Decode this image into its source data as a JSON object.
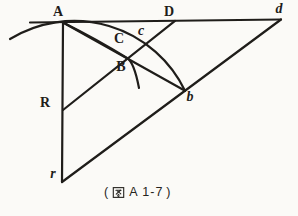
{
  "figure": {
    "caption": {
      "full": "( 图 A 1-7 )",
      "open": "(",
      "cjk": "图",
      "text": "A 1-7",
      "close": ")"
    },
    "labels": {
      "A": "A",
      "D": "D",
      "d": "d",
      "C": "C",
      "c": "c",
      "B": "B",
      "R": "R",
      "b": "b",
      "r": "r"
    },
    "colors": {
      "ink": "#1f1d1a",
      "background": "#fbfaf7"
    }
  }
}
